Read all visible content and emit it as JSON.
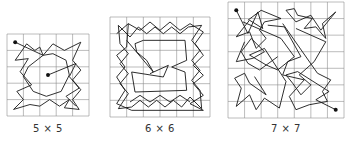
{
  "figures": [
    {
      "id": "grid-5x5",
      "caption": "5 × 5",
      "n": 5,
      "x": 7,
      "y": 34,
      "size": 82,
      "caption_x": 48,
      "caption_y": 123,
      "endpoints": [
        [
          0.5,
          0.5
        ],
        [
          2.5,
          2.5
        ]
      ],
      "path": [
        [
          0.5,
          0.5
        ],
        [
          2.2,
          1.3
        ],
        [
          2.0,
          0.8
        ],
        [
          1.7,
          1.0
        ],
        [
          1.2,
          0.6
        ],
        [
          0.5,
          1.6
        ],
        [
          1.3,
          1.5
        ],
        [
          0.8,
          2.3
        ],
        [
          1.5,
          3.1
        ],
        [
          0.6,
          3.5
        ],
        [
          1.0,
          4.0
        ],
        [
          0.4,
          4.6
        ],
        [
          1.4,
          4.3
        ],
        [
          2.0,
          4.4
        ],
        [
          2.6,
          4.0
        ],
        [
          3.2,
          4.4
        ],
        [
          3.8,
          4.0
        ],
        [
          3.5,
          4.5
        ],
        [
          4.4,
          4.6
        ],
        [
          4.0,
          4.0
        ],
        [
          4.5,
          3.4
        ],
        [
          4.0,
          2.8
        ],
        [
          4.5,
          2.2
        ],
        [
          4.0,
          1.6
        ],
        [
          4.5,
          0.5
        ],
        [
          3.5,
          1.0
        ],
        [
          2.8,
          0.6
        ],
        [
          2.2,
          1.3
        ],
        [
          1.3,
          2.0
        ],
        [
          1.0,
          2.6
        ],
        [
          1.6,
          3.5
        ],
        [
          2.4,
          3.8
        ],
        [
          3.3,
          3.5
        ],
        [
          3.8,
          2.5
        ],
        [
          3.6,
          1.6
        ],
        [
          2.8,
          1.2
        ],
        [
          2.2,
          1.3
        ]
      ],
      "path2": [
        [
          2.5,
          2.5
        ],
        [
          4.2,
          1.8
        ],
        [
          3.8,
          2.6
        ],
        [
          4.4,
          3.3
        ],
        [
          3.6,
          3.8
        ],
        [
          4.2,
          4.4
        ]
      ]
    },
    {
      "id": "grid-6x6",
      "caption": "6 × 6",
      "n": 6,
      "x": 110,
      "y": 17,
      "size": 100,
      "caption_x": 160,
      "caption_y": 123,
      "endpoints": [],
      "path": [
        [
          0.5,
          0.5
        ],
        [
          1.2,
          1.2
        ],
        [
          1.7,
          0.6
        ],
        [
          2.2,
          1.0
        ],
        [
          2.7,
          0.6
        ],
        [
          3.2,
          1.0
        ],
        [
          3.7,
          0.6
        ],
        [
          4.2,
          1.0
        ],
        [
          4.7,
          0.6
        ],
        [
          5.5,
          0.5
        ],
        [
          4.9,
          1.4
        ],
        [
          5.4,
          2.0
        ],
        [
          4.9,
          2.6
        ],
        [
          5.4,
          3.2
        ],
        [
          4.9,
          3.8
        ],
        [
          5.4,
          4.4
        ],
        [
          5.5,
          5.5
        ],
        [
          4.8,
          4.8
        ],
        [
          4.3,
          5.4
        ],
        [
          3.8,
          5.0
        ],
        [
          3.3,
          5.4
        ],
        [
          2.8,
          5.0
        ],
        [
          2.3,
          5.4
        ],
        [
          1.8,
          5.0
        ],
        [
          1.3,
          5.4
        ],
        [
          0.5,
          5.5
        ],
        [
          1.1,
          4.6
        ],
        [
          0.6,
          4.0
        ],
        [
          1.1,
          3.4
        ],
        [
          0.6,
          2.8
        ],
        [
          1.1,
          2.2
        ],
        [
          0.6,
          1.6
        ],
        [
          0.5,
          0.5
        ]
      ],
      "path2": [
        [
          1.0,
          1.4
        ],
        [
          2.6,
          3.3
        ],
        [
          2.2,
          2.6
        ],
        [
          1.6,
          2.1
        ],
        [
          1.5,
          1.6
        ],
        [
          2.0,
          1.4
        ],
        [
          4.5,
          1.4
        ],
        [
          4.6,
          2.6
        ],
        [
          3.7,
          3.0
        ],
        [
          4.5,
          3.3
        ],
        [
          4.6,
          4.4
        ],
        [
          1.5,
          4.5
        ],
        [
          1.3,
          3.3
        ],
        [
          3.2,
          3.6
        ],
        [
          3.5,
          2.9
        ],
        [
          2.4,
          3.4
        ]
      ],
      "path3": [
        [
          0.4,
          1.0
        ],
        [
          1.1,
          0.4
        ],
        [
          1.0,
          1.8
        ],
        [
          0.4,
          2.3
        ],
        [
          0.9,
          3.0
        ],
        [
          0.4,
          3.6
        ],
        [
          0.9,
          4.4
        ],
        [
          0.4,
          5.2
        ],
        [
          1.3,
          5.6
        ],
        [
          5.6,
          5.6
        ],
        [
          4.8,
          5.2
        ],
        [
          5.6,
          4.7
        ],
        [
          5.0,
          4.0
        ],
        [
          5.6,
          3.5
        ],
        [
          5.0,
          2.9
        ],
        [
          5.6,
          2.3
        ],
        [
          5.1,
          1.6
        ],
        [
          5.6,
          0.9
        ],
        [
          4.8,
          0.4
        ],
        [
          4.2,
          0.8
        ],
        [
          3.6,
          0.3
        ],
        [
          3.0,
          0.8
        ],
        [
          2.4,
          0.3
        ],
        [
          1.8,
          0.8
        ],
        [
          1.1,
          0.4
        ]
      ],
      "path4": [
        [
          1.2,
          5.1
        ],
        [
          1.8,
          4.7
        ],
        [
          2.4,
          5.1
        ],
        [
          3.0,
          4.7
        ],
        [
          3.6,
          5.1
        ],
        [
          4.2,
          4.7
        ],
        [
          4.8,
          5.1
        ]
      ]
    },
    {
      "id": "grid-7x7",
      "caption": "7 × 7",
      "n": 7,
      "x": 228,
      "y": 2,
      "size": 116,
      "caption_x": 286,
      "caption_y": 123,
      "endpoints": [
        [
          0.5,
          0.5
        ],
        [
          6.5,
          6.5
        ]
      ],
      "path": [
        [
          0.5,
          0.5
        ],
        [
          1.2,
          1.9
        ],
        [
          1.8,
          0.6
        ],
        [
          2.1,
          1.6
        ],
        [
          1.3,
          1.1
        ],
        [
          0.5,
          2.1
        ],
        [
          1.3,
          1.8
        ],
        [
          1.7,
          2.8
        ],
        [
          2.3,
          2.2
        ],
        [
          1.9,
          1.7
        ],
        [
          2.2,
          1.2
        ],
        [
          3.2,
          1.0
        ],
        [
          2.0,
          0.5
        ],
        [
          1.2,
          1.1
        ]
      ],
      "path2": [
        [
          3.5,
          0.5
        ],
        [
          4.1,
          1.2
        ],
        [
          5.0,
          0.8
        ],
        [
          5.6,
          1.7
        ],
        [
          6.5,
          0.6
        ],
        [
          5.7,
          1.3
        ],
        [
          5.9,
          2.2
        ],
        [
          5.3,
          1.5
        ],
        [
          4.6,
          1.6
        ],
        [
          5.1,
          1.0
        ],
        [
          4.2,
          0.8
        ],
        [
          4.0,
          0.4
        ],
        [
          3.5,
          0.5
        ]
      ],
      "path3": [
        [
          0.9,
          1.2
        ],
        [
          3.2,
          2.2
        ],
        [
          4.0,
          3.3
        ],
        [
          3.0,
          4.1
        ],
        [
          2.3,
          3.8
        ],
        [
          1.3,
          3.2
        ],
        [
          2.2,
          2.8
        ],
        [
          3.5,
          4.8
        ],
        [
          3.1,
          6.4
        ],
        [
          2.2,
          5.8
        ],
        [
          1.7,
          6.5
        ],
        [
          1.3,
          5.6
        ],
        [
          0.5,
          6.3
        ],
        [
          0.8,
          5.2
        ],
        [
          0.4,
          4.6
        ],
        [
          1.0,
          4.3
        ],
        [
          1.3,
          4.9
        ],
        [
          2.3,
          5.6
        ],
        [
          1.6,
          4.5
        ]
      ],
      "path4": [
        [
          4.1,
          1.6
        ],
        [
          5.9,
          2.4
        ],
        [
          5.2,
          3.6
        ],
        [
          4.3,
          4.4
        ],
        [
          5.0,
          5.0
        ],
        [
          4.4,
          5.6
        ],
        [
          3.9,
          4.9
        ],
        [
          3.5,
          4.4
        ],
        [
          4.2,
          4.2
        ],
        [
          6.1,
          5.4
        ],
        [
          5.3,
          5.9
        ],
        [
          6.5,
          6.5
        ]
      ],
      "path5": [
        [
          3.3,
          1.3
        ],
        [
          5.4,
          4.3
        ],
        [
          6.2,
          4.7
        ],
        [
          5.7,
          5.4
        ],
        [
          6.0,
          6.0
        ],
        [
          4.9,
          6.2
        ],
        [
          4.1,
          6.5
        ],
        [
          3.7,
          5.7
        ],
        [
          4.6,
          4.7
        ],
        [
          3.3,
          4.4
        ],
        [
          3.6,
          3.6
        ],
        [
          4.4,
          3.3
        ],
        [
          3.4,
          1.5
        ],
        [
          2.4,
          1.4
        ]
      ],
      "path6": [
        [
          1.0,
          2.4
        ],
        [
          0.5,
          3.6
        ],
        [
          1.5,
          3.4
        ],
        [
          2.2,
          3.0
        ],
        [
          1.4,
          2.2
        ],
        [
          0.8,
          3.0
        ],
        [
          1.2,
          3.7
        ],
        [
          1.9,
          4.1
        ],
        [
          3.0,
          3.3
        ]
      ]
    }
  ],
  "style": {
    "grid_color": "#8a8a8a",
    "line_color": "#1a1a1a",
    "dot_color": "#111111",
    "caption_color": "#333333"
  }
}
